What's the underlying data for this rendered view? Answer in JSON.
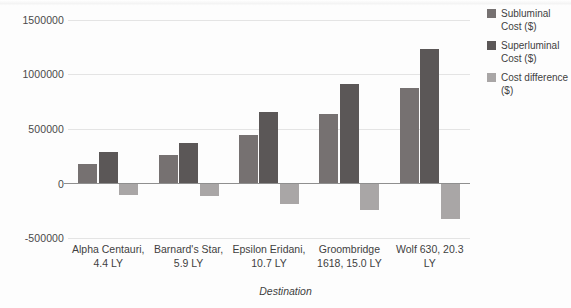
{
  "chart_data": {
    "type": "bar",
    "title": "",
    "xlabel": "Destination",
    "ylabel": "",
    "categories": [
      "Alpha Centauri, 4.4 LY",
      "Barnard's Star, 5.9 LY",
      "Epsilon Eridani, 10.7 LY",
      "Groombridge 1618, 15.0 LY",
      "Wolf 630, 20.3 LY"
    ],
    "series": [
      {
        "name": "Subluminal Cost ($)",
        "color": "#767171",
        "values": [
          180000,
          260000,
          445000,
          640000,
          880000
        ]
      },
      {
        "name": "Superluminal Cost ($)",
        "color": "#5b5757",
        "values": [
          285000,
          370000,
          655000,
          915000,
          1230000
        ]
      },
      {
        "name": "Cost difference ($)",
        "color": "#a9a6a6",
        "values": [
          -105000,
          -118000,
          -188000,
          -245000,
          -330000
        ]
      }
    ],
    "ylim": [
      -500000,
      1500000
    ],
    "yticks": [
      1500000,
      1000000,
      500000,
      0,
      -500000
    ],
    "ytick_labels": [
      "1500000",
      "1000000",
      "500000",
      "0",
      "-500000"
    ],
    "grid": true,
    "legend_position": "right"
  },
  "legend": {
    "items": [
      {
        "label": "Subluminal Cost ($)"
      },
      {
        "label": "Superluminal Cost ($)"
      },
      {
        "label": "Cost difference ($)"
      }
    ]
  },
  "axis": {
    "x_title": "Destination",
    "tick_labels": [
      "1500000",
      "1000000",
      "500000",
      "0",
      "-500000"
    ],
    "category_labels": [
      "Alpha Centauri, 4.4 LY",
      "Barnard's Star, 5.9 LY",
      "Epsilon Eridani, 10.7 LY",
      "Groombridge 1618, 15.0 LY",
      "Wolf 630, 20.3 LY"
    ]
  }
}
